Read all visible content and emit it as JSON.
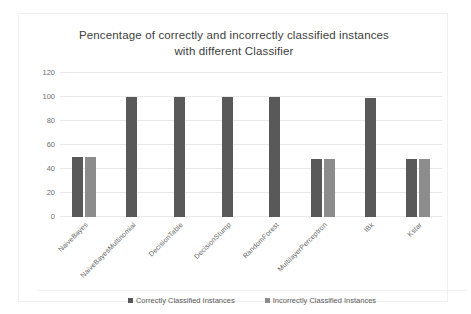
{
  "chart_data": {
    "type": "bar",
    "title": "Pencentage of correctly and incorrectly classified instances with different Classifier",
    "title_lines": [
      "Pencentage of correctly and incorrectly classified instances",
      "with different Classifier"
    ],
    "xlabel": "",
    "ylabel": "",
    "ylim": [
      0,
      120
    ],
    "yticks": [
      0,
      20,
      40,
      60,
      80,
      100,
      120
    ],
    "ytick_labels": [
      "0",
      "20",
      "40",
      "60",
      "80",
      "100",
      "120"
    ],
    "grid": true,
    "legend_position": "bottom",
    "categories": [
      "NaiveBayes",
      "NaiveBayesMultinomial",
      "DecisionTable",
      "DecisionStump",
      "RandomForest",
      "MultilayerPerceptron",
      "IBk",
      "Kstar"
    ],
    "series": [
      {
        "name": "Correctly Classified Instances",
        "color": "#595959",
        "values": [
          50,
          100,
          100,
          100,
          100,
          48,
          99,
          48
        ]
      },
      {
        "name": "Incorrectly Classified Instances",
        "color": "#8c8c8c",
        "values": [
          50,
          0,
          0,
          0,
          0,
          48,
          0,
          48
        ]
      }
    ]
  },
  "legend": {
    "entries": [
      {
        "label": "Correctly Classified Instances"
      },
      {
        "label": "Incorrectly Classified Instances"
      }
    ]
  }
}
